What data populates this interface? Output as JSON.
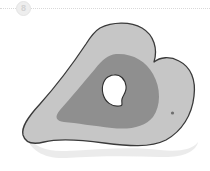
{
  "header": {
    "badge_label": "8",
    "badge_icon": "numbered-step-badge",
    "divider_icon": "dotted-divider-line"
  },
  "figure": {
    "name": "anatomical-blob-diagram",
    "caption": "",
    "colors": {
      "background": "#ffffff",
      "outer_body_fill": "#c6c6c6",
      "outer_body_stroke": "#3a3a3a",
      "inner_region_fill": "#8f8f8f",
      "hole_fill": "#ffffff",
      "hole_stroke": "#2e2e2e",
      "marker_dot": "#6e6e6e",
      "shadow": "#e8e8e8",
      "badge_bg": "#eeeeee",
      "badge_text": "#d3d3d3",
      "divider": "#d9d9d9"
    },
    "regions": [
      {
        "name": "outer-body",
        "label": ""
      },
      {
        "name": "inner-region",
        "label": ""
      },
      {
        "name": "central-cavity",
        "label": ""
      },
      {
        "name": "marker-dot",
        "label": ""
      },
      {
        "name": "drop-shadow",
        "label": ""
      }
    ]
  }
}
